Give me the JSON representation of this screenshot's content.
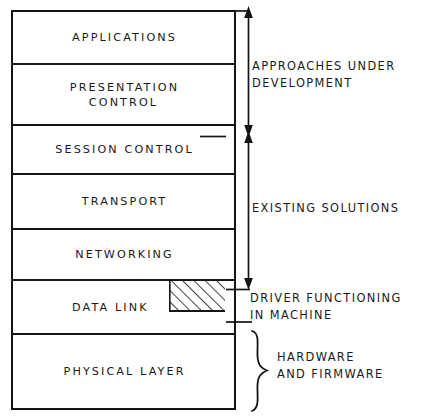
{
  "diagram": {
    "layer_stack": {
      "name": "osi-layer-stack",
      "layers": [
        {
          "id": "applications",
          "label": "APPLICATIONS",
          "top": 10,
          "bottom": 63
        },
        {
          "id": "presentation-control",
          "label": "PRESENTATION\nCONTROL",
          "top": 63,
          "bottom": 124
        },
        {
          "id": "session-control",
          "label": "SESSION CONTROL",
          "top": 124,
          "bottom": 173
        },
        {
          "id": "transport",
          "label": "TRANSPORT",
          "top": 173,
          "bottom": 228
        },
        {
          "id": "networking",
          "label": "NETWORKING",
          "top": 228,
          "bottom": 279
        },
        {
          "id": "data-link",
          "label": "DATA LINK",
          "top": 279,
          "bottom": 333
        },
        {
          "id": "physical-layer",
          "label": "PHYSICAL LAYER",
          "top": 333,
          "bottom": 410
        }
      ]
    },
    "annotations": [
      {
        "id": "approaches-under-development",
        "text": "APPROACHES UNDER\nDEVELOPMENT"
      },
      {
        "id": "existing-solutions",
        "text": "EXISTING SOLUTIONS"
      },
      {
        "id": "driver-functioning-in-machine",
        "text": "DRIVER FUNCTIONING\nIN MACHINE"
      },
      {
        "id": "hardware-and-firmware",
        "text": "HARDWARE\nAND FIRMWARE"
      }
    ],
    "markers": {
      "hatched_region_label": "driver-hatched-region",
      "upper_arrow_label": "double-arrow-approaches",
      "lower_arrow_label": "double-arrow-existing",
      "brace_label": "hardware-firmware-brace"
    },
    "colors": {
      "line": "#141414",
      "text": "#1a1a1a",
      "background": "#ffffff"
    }
  }
}
